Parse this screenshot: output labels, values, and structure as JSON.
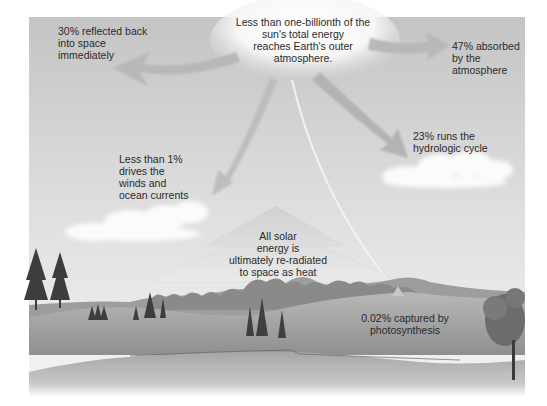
{
  "diagram": {
    "colors": {
      "sky_top": "#c9c9c9",
      "sky_bottom": "#efefef",
      "arrow_fill": "#b5b5b5",
      "sun_glow": "#ffffff",
      "text": "#2a2a2a",
      "ground": "#9a9a9a"
    },
    "labels": {
      "sun": "Less than one-billionth of the\nsun's total energy\nreaches Earth's outer\natmosphere.",
      "reflected": "30% reflected back\ninto space\nimmediately",
      "absorbed": "47% absorbed\nby the\natmosphere",
      "hydrologic": "23% runs the\nhydrologic cycle",
      "winds": "Less than 1%\ndrives the\nwinds and\nocean currents",
      "reradiated": "All solar\nenergy is\nultimately re-radiated\nto space as heat",
      "photosynthesis": "0.02% captured by\nphotosynthesis"
    },
    "flows": [
      {
        "name": "reflected",
        "percent": "30%"
      },
      {
        "name": "absorbed",
        "percent": "47%"
      },
      {
        "name": "hydrologic",
        "percent": "23%"
      },
      {
        "name": "winds",
        "percent": "<1%"
      },
      {
        "name": "photosynthesis",
        "percent": "0.02%"
      }
    ]
  }
}
